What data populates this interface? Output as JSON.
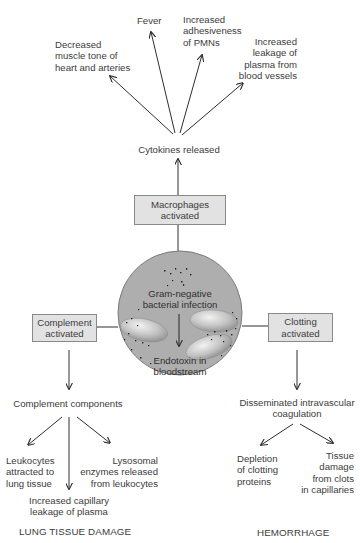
{
  "diagram": {
    "center": {
      "top_label": "Gram-negative\nbacterial infection",
      "bottom_label": "Endotoxin in\nbloodstream",
      "fill_color": "#aeaeae"
    },
    "top_branch": {
      "box_label": "Macrophages\nactivated",
      "intermediate": "Cytokines released",
      "effects": [
        "Decreased\nmuscle tone of\nheart and arteries",
        "Fever",
        "Increased\nadhesiveness\nof PMNs",
        "Increased\nleakage of\nplasma from\nblood vessels"
      ]
    },
    "left_branch": {
      "box_label": "Complement\nactivated",
      "intermediate": "Complement components",
      "effects": [
        "Leukocytes\nattracted to\nlung tissue",
        "Increased capillary\nleakage of plasma",
        "Lysosomal\nenzymes released\nfrom leukocytes"
      ],
      "outcome": "LUNG TISSUE DAMAGE"
    },
    "right_branch": {
      "box_label": "Clotting\nactivated",
      "intermediate": "Disseminated intravascular\ncoagulation",
      "effects": [
        "Depletion\nof clotting\nproteins",
        "Tissue\ndamage\nfrom clots\nin capillaries"
      ],
      "outcome": "HEMORRHAGE"
    },
    "colors": {
      "box_fill": "#e2e2e2",
      "box_border": "#8a8a8a",
      "line": "#2e2e2e",
      "text": "#3c3c3c",
      "circle": "#aeaeae"
    }
  }
}
